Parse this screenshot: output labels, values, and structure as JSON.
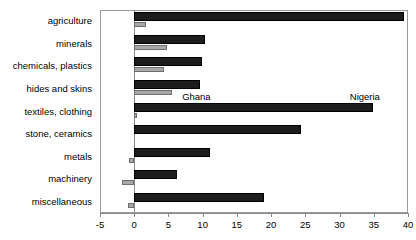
{
  "chart_data": {
    "type": "bar",
    "orientation": "horizontal",
    "title": "",
    "subtitle": "",
    "xlabel": "",
    "ylabel": "",
    "xlim": [
      -5,
      40
    ],
    "xticks": [
      -5,
      0,
      5,
      10,
      15,
      20,
      25,
      30,
      35,
      40
    ],
    "xtick_labels": [
      "-5",
      "0",
      "5",
      "10",
      "15",
      "20",
      "25",
      "30",
      "35",
      "40"
    ],
    "grid": false,
    "legend_position": "inline-annotation",
    "categories": [
      "agriculture",
      "minerals",
      "chemicals, plastics",
      "hides and skins",
      "textiles, clothing",
      "stone, ceramics",
      "metals",
      "machinery",
      "miscellaneous"
    ],
    "series": [
      {
        "name": "Nigeria",
        "color": "#1c1c1c",
        "values": [
          39.4,
          10.4,
          9.9,
          9.6,
          34.9,
          24.3,
          11.0,
          6.2,
          19.0
        ]
      },
      {
        "name": "Ghana",
        "color": "#a8a8a8",
        "values": [
          1.7,
          4.8,
          4.4,
          5.5,
          0.4,
          0.0,
          -0.8,
          -1.8,
          -0.9
        ]
      }
    ],
    "annotations": [
      {
        "text": "Ghana",
        "x": 7.0,
        "category": "hides and skins"
      },
      {
        "text": "Nigeria",
        "x": 31.5,
        "category": "hides and skins"
      }
    ]
  }
}
